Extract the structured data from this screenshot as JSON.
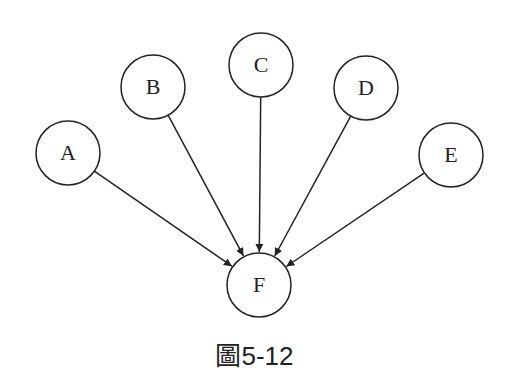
{
  "nodes": [
    {
      "id": "A",
      "label": "A",
      "cx": 68,
      "cy": 153,
      "r": 32
    },
    {
      "id": "B",
      "label": "B",
      "cx": 153,
      "cy": 87,
      "r": 32
    },
    {
      "id": "C",
      "label": "C",
      "cx": 261,
      "cy": 65,
      "r": 32
    },
    {
      "id": "D",
      "label": "D",
      "cx": 366,
      "cy": 88,
      "r": 32
    },
    {
      "id": "E",
      "label": "E",
      "cx": 451,
      "cy": 155,
      "r": 32
    },
    {
      "id": "F",
      "label": "F",
      "cx": 259,
      "cy": 285,
      "r": 32
    }
  ],
  "edges": [
    {
      "from": "A",
      "to": "F"
    },
    {
      "from": "B",
      "to": "F"
    },
    {
      "from": "C",
      "to": "F"
    },
    {
      "from": "D",
      "to": "F"
    },
    {
      "from": "E",
      "to": "F"
    }
  ],
  "caption": "圖5-12",
  "colors": {
    "stroke": "#222222",
    "background": "#ffffff"
  }
}
